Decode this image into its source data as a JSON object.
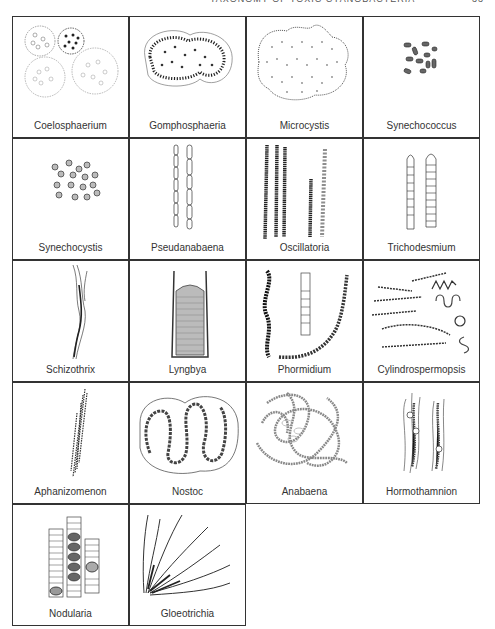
{
  "running_head": {
    "title": "TAXONOMY OF TOXIC CYANOBACTERIA",
    "page": "33"
  },
  "figure": {
    "columns": 4,
    "rows": 5,
    "genera": [
      {
        "name": "Coelosphaerium",
        "icon": "colony-spheres-icon"
      },
      {
        "name": "Gomphosphaeria",
        "icon": "lobed-colony-icon"
      },
      {
        "name": "Microcystis",
        "icon": "irregular-colony-icon"
      },
      {
        "name": "Synechococcus",
        "icon": "rod-cells-icon"
      },
      {
        "name": "Synechocystis",
        "icon": "spherical-cells-icon"
      },
      {
        "name": "Pseudanabaena",
        "icon": "segmented-filament-icon"
      },
      {
        "name": "Oscillatoria",
        "icon": "straight-trichomes-icon"
      },
      {
        "name": "Trichodesmium",
        "icon": "banded-trichomes-icon"
      },
      {
        "name": "Schizothrix",
        "icon": "sheathed-filament-icon"
      },
      {
        "name": "Lyngbya",
        "icon": "sheathed-trichome-icon"
      },
      {
        "name": "Phormidium",
        "icon": "curved-trichomes-icon"
      },
      {
        "name": "Cylindrospermopsis",
        "icon": "coiled-filaments-icon"
      },
      {
        "name": "Aphanizomenon",
        "icon": "filament-bundle-icon"
      },
      {
        "name": "Nostoc",
        "icon": "coiled-chain-colony-icon"
      },
      {
        "name": "Anabaena",
        "icon": "tangled-chains-icon"
      },
      {
        "name": "Hormothamnion",
        "icon": "sheathed-chains-icon"
      },
      {
        "name": "Nodularia",
        "icon": "disc-cell-filaments-icon"
      },
      {
        "name": "Gloeotrichia",
        "icon": "radiating-filaments-icon"
      }
    ]
  }
}
